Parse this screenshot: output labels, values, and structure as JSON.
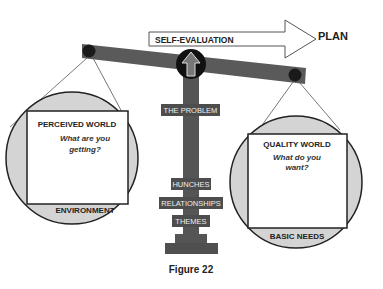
{
  "diagram": {
    "arrow": {
      "label": "SELF-EVALUATION",
      "target": "PLAN"
    },
    "left_pan": {
      "title": "PERCEIVED WORLD",
      "question_line1": "What are you",
      "question_line2": "getting?",
      "footer": "ENVIRONMENT"
    },
    "right_pan": {
      "title": "QUALITY WORLD",
      "question_line1": "What do you",
      "question_line2": "want?",
      "footer": "BASIC NEEDS"
    },
    "column_labels": {
      "problem": "THE PROBLEM",
      "hunches": "HUNCHES",
      "relationships": "RELATIONSHIPS",
      "themes": "THEMES"
    },
    "fulcrum_icon": "up-arrow-icon",
    "caption": "Figure 22",
    "colors": {
      "beam": "#5a5a5a",
      "column": "#555555",
      "pan_fill": "#d4d4d4",
      "dot": "#1a1a1a",
      "tag_bg": "#4d4d4d"
    }
  }
}
